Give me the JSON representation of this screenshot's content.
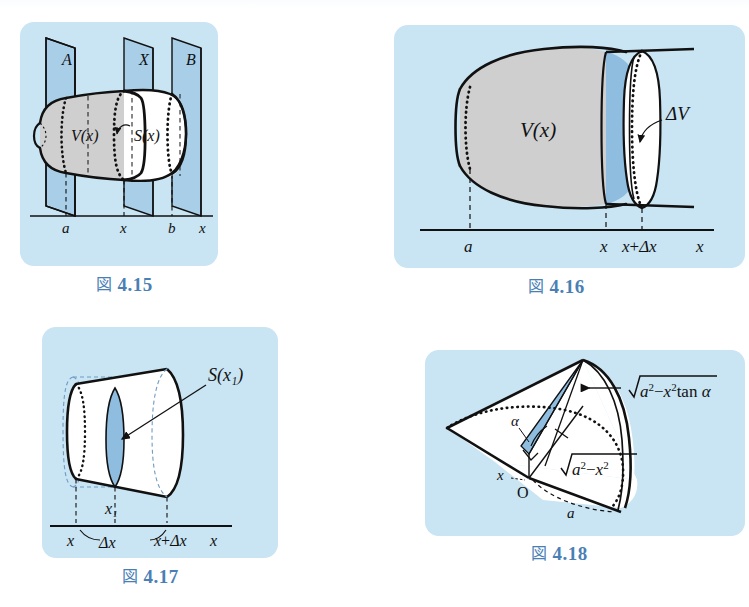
{
  "page": {
    "background": "#ffffff",
    "panel_background": "#c9e4f2",
    "plane_fill": "#a9cfe8",
    "solid_gray_fill": "#cfcfcf",
    "slice_blue_fill": "#8fbde0",
    "caption_color": "#4a7fb5",
    "ink_color": "#111111"
  },
  "figures": [
    {
      "id": "fig-4-15",
      "caption_kanji": "図",
      "caption_number": "4.15",
      "caption": "図 4.15",
      "description": "Solid of revolution cut by three vertical planes A, X, B with volume V(x) and cross-section S(x)",
      "labels": {
        "plane_a": "A",
        "plane_x": "X",
        "plane_b": "B",
        "volume": "V(x)",
        "section": "S(x)",
        "tick_a": "a",
        "tick_x": "x",
        "tick_b": "b",
        "axis": "x"
      }
    },
    {
      "id": "fig-4-16",
      "caption_kanji": "図",
      "caption_number": "4.16",
      "caption": "図 4.16",
      "description": "Solid from a to x with a thin slab of volume ΔV between x and x+Δx",
      "labels": {
        "volume": "V(x)",
        "delta_volume": "ΔV",
        "tick_a": "a",
        "tick_x": "x",
        "tick_x_plus_dx": "x+Δx",
        "axis": "x"
      }
    },
    {
      "id": "fig-4-17",
      "caption_kanji": "図",
      "caption_number": "4.17",
      "caption": "図 4.17",
      "description": "Slab between x and x+Δx with representative cross-section S(x₁) at x₁",
      "labels": {
        "section": "S(x₁)",
        "tick_x1": "x₁",
        "tick_x": "x",
        "tick_dx": "Δx",
        "tick_x_plus_dx": "x+Δx",
        "axis": "x"
      }
    },
    {
      "id": "fig-4-18",
      "caption_kanji": "図",
      "caption_number": "4.18",
      "caption": "図 4.18",
      "description": "Wedge cut from a cylinder of radius a at angle α, with triangular cross-section",
      "labels": {
        "height": "√(a²−x²) tan α",
        "height_radical": "a²−x²",
        "height_suffix": "tan α",
        "base": "√(a²−x²)",
        "base_radical": "a²−x²",
        "angle": "α",
        "origin": "O",
        "x_label": "x",
        "radius": "a"
      }
    }
  ]
}
